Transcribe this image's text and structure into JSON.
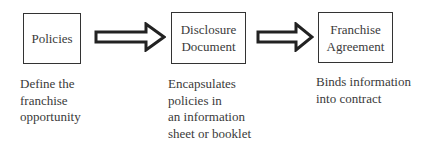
{
  "diagram": {
    "type": "flow",
    "nodes": [
      {
        "id": "policies",
        "label": "Policies",
        "description": "Define the\nfranchise\nopportunity"
      },
      {
        "id": "disclosure",
        "label": "Disclosure\nDocument",
        "description": "Encapsulates\npolicies in\nan information\nsheet or booklet"
      },
      {
        "id": "agreement",
        "label": "Franchise\nAgreement",
        "description": "Binds information\ninto contract"
      }
    ],
    "edges": [
      {
        "from": "policies",
        "to": "disclosure",
        "style": "block-arrow"
      },
      {
        "from": "disclosure",
        "to": "agreement",
        "style": "block-arrow"
      }
    ]
  }
}
